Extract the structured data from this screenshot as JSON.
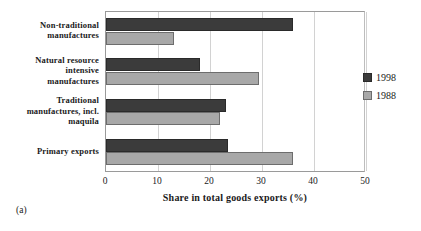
{
  "caption": "(a)",
  "chart_data": {
    "type": "bar",
    "orientation": "horizontal",
    "title": "",
    "xlabel": "Share in total goods exports (%)",
    "ylabel": "",
    "xlim": [
      0,
      50
    ],
    "xticks": [
      0,
      10,
      20,
      30,
      40,
      50
    ],
    "xtick_labels": [
      "0",
      "10",
      "20",
      "30",
      "40",
      "50"
    ],
    "grid": true,
    "legend_position": "right",
    "categories": [
      "Non-traditional manufactures",
      "Natural resource intensive manufactures",
      "Traditional manufactures, incl. maquila",
      "Primary exports"
    ],
    "category_label_lines": [
      [
        "Non-traditional",
        "manufactures"
      ],
      [
        "Natural resource",
        "intensive",
        "manufactures"
      ],
      [
        "Traditional",
        "manufactures, incl.",
        "maquila"
      ],
      [
        "Primary exports"
      ]
    ],
    "series": [
      {
        "name": "1998",
        "color": "#3b3b3b",
        "values": [
          36.0,
          18.0,
          23.0,
          23.5
        ]
      },
      {
        "name": "1988",
        "color": "#a8a8a8",
        "values": [
          13.0,
          29.5,
          22.0,
          36.0
        ]
      }
    ]
  }
}
